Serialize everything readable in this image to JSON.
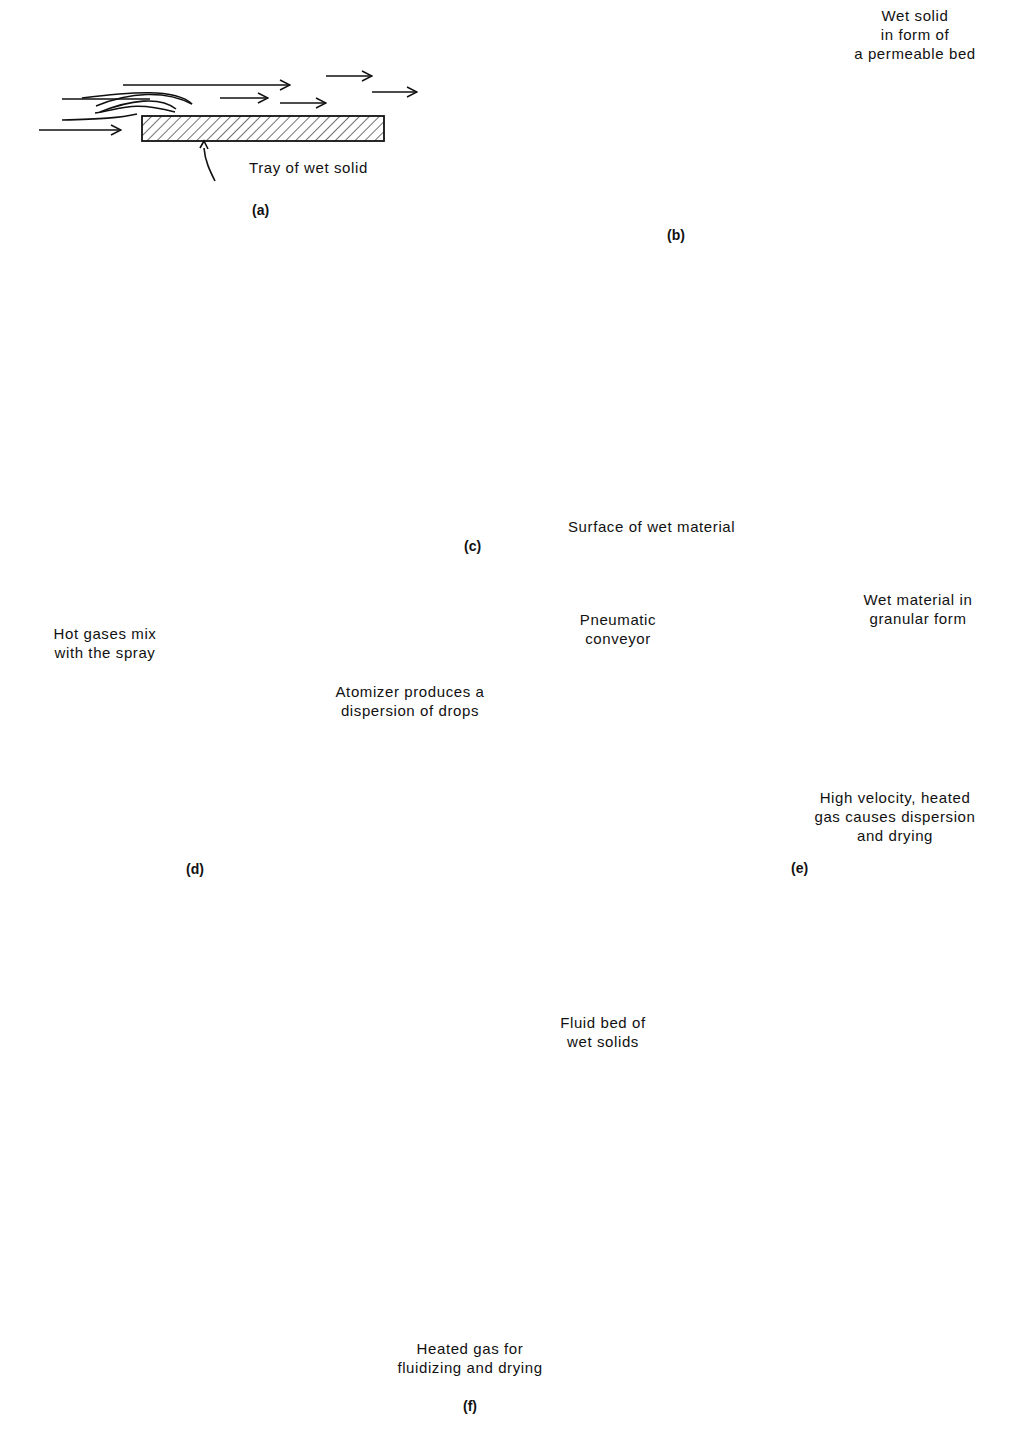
{
  "figure": {
    "panels": [
      {
        "id": "a",
        "caption": "(a)",
        "labels": [
          "Tray of wet solid"
        ]
      },
      {
        "id": "b",
        "caption": "(b)",
        "labels": [
          "Wet solid",
          "in form of",
          "a permeable bed"
        ]
      },
      {
        "id": "c",
        "caption": "(c)",
        "labels": [
          "Surface of wet material"
        ]
      },
      {
        "id": "d",
        "caption": "(d)",
        "labels": [
          "Hot gases mix",
          "with the spray",
          "Atomizer produces a",
          "dispersion of drops"
        ]
      },
      {
        "id": "e",
        "caption": "(e)",
        "labels": [
          "Pneumatic",
          "conveyor",
          "Wet material in",
          "granular form",
          "High velocity, heated",
          "gas causes dispersion",
          "and drying"
        ]
      },
      {
        "id": "f",
        "caption": "(f)",
        "labels": [
          "Fluid bed of",
          "wet solids",
          "Heated gas for",
          "fluidizing and drying"
        ]
      }
    ]
  }
}
